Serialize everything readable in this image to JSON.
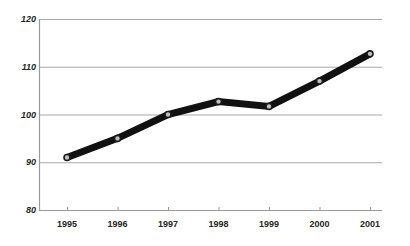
{
  "chart_data": {
    "type": "line",
    "title": "",
    "subtitle": "",
    "xlabel": "",
    "ylabel": "",
    "categories": [
      "1995",
      "1996",
      "1997",
      "1998",
      "1999",
      "2000",
      "2001"
    ],
    "series": [
      {
        "name": "",
        "values": [
          91,
          95,
          100,
          102.7,
          101.7,
          107,
          112.7
        ]
      }
    ],
    "ylim": [
      80,
      120
    ],
    "y_ticks": [
      "80",
      "90",
      "100",
      "110",
      "120"
    ],
    "y_tick_values": [
      80,
      90,
      100,
      110,
      120
    ],
    "x_ticks": [
      "1995",
      "1996",
      "1997",
      "1998",
      "1999",
      "2000",
      "2001"
    ],
    "grid": "horizontal",
    "legend": "none",
    "annotations": [],
    "colors": {
      "line": "#111111",
      "marker_fill": "#bfbfbf",
      "marker_edge": "#1a1a1a",
      "gridline": "#a8a8a8",
      "axis": "#9a9a9a",
      "text": "#262626",
      "background": "#ffffff"
    },
    "style": {
      "line_width_px": 7,
      "marker_radius_px": 3,
      "y_label_italic": true,
      "x_label_italic": false
    }
  }
}
